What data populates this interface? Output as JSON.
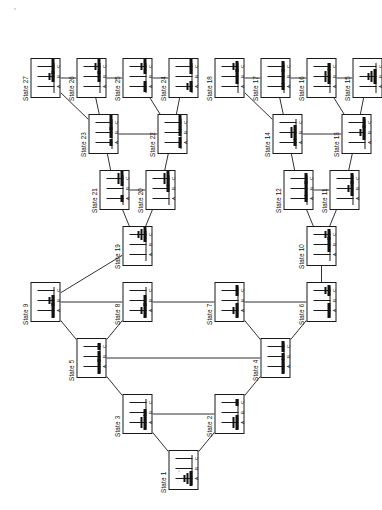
{
  "diagram": {
    "type": "tree",
    "peg_labels": [
      "A",
      "B",
      "C"
    ],
    "disk_count": 3,
    "state_count": 27,
    "label_prefix": "State",
    "stroke_color": "#1a1a1a",
    "disk_color": "#111111",
    "background": "#ffffff"
  },
  "states": [
    {
      "id": 1,
      "label": "State 1",
      "pegs": [
        [
          3,
          2,
          1
        ],
        [],
        []
      ],
      "x": 20,
      "y": 168
    },
    {
      "id": 2,
      "label": "State 2",
      "pegs": [
        [
          3,
          2
        ],
        [],
        [
          1
        ]
      ],
      "x": 76,
      "y": 214
    },
    {
      "id": 3,
      "label": "State 3",
      "pegs": [
        [
          3,
          2
        ],
        [
          1
        ],
        []
      ],
      "x": 76,
      "y": 122
    },
    {
      "id": 4,
      "label": "State 4",
      "pegs": [
        [
          3
        ],
        [
          1
        ],
        [
          2
        ]
      ],
      "x": 132,
      "y": 260
    },
    {
      "id": 5,
      "label": "State 5",
      "pegs": [
        [
          3
        ],
        [
          2
        ],
        [
          1
        ]
      ],
      "x": 132,
      "y": 76
    },
    {
      "id": 6,
      "label": "State 6",
      "pegs": [
        [
          3
        ],
        [],
        [
          2,
          1
        ]
      ],
      "x": 188,
      "y": 306
    },
    {
      "id": 7,
      "label": "State 7",
      "pegs": [
        [
          3,
          1
        ],
        [],
        [
          2
        ]
      ],
      "x": 188,
      "y": 214
    },
    {
      "id": 8,
      "label": "State 8",
      "pegs": [
        [
          3,
          1
        ],
        [
          2
        ],
        []
      ],
      "x": 188,
      "y": 122
    },
    {
      "id": 9,
      "label": "State 9",
      "pegs": [
        [
          3
        ],
        [
          2,
          1
        ],
        []
      ],
      "x": 188,
      "y": 30
    },
    {
      "id": 10,
      "label": "State 10",
      "pegs": [
        [],
        [
          3
        ],
        [
          2,
          1
        ]
      ],
      "x": 244,
      "y": 306
    },
    {
      "id": 11,
      "label": "State 11",
      "pegs": [
        [],
        [
          3,
          1
        ],
        [
          2
        ]
      ],
      "x": 300,
      "y": 329
    },
    {
      "id": 12,
      "label": "State 12",
      "pegs": [
        [
          1
        ],
        [
          3
        ],
        [
          2
        ]
      ],
      "x": 300,
      "y": 283
    },
    {
      "id": 13,
      "label": "State 13",
      "pegs": [
        [],
        [
          3,
          1
        ],
        [
          2
        ]
      ],
      "x": 356,
      "y": 341
    },
    {
      "id": 14,
      "label": "State 14",
      "pegs": [
        [
          1
        ],
        [
          3,
          2
        ],
        []
      ],
      "x": 356,
      "y": 272
    },
    {
      "id": 15,
      "label": "State 15",
      "pegs": [
        [],
        [
          3,
          2,
          1
        ],
        []
      ],
      "x": 412,
      "y": 352
    },
    {
      "id": 16,
      "label": "State 16",
      "pegs": [
        [],
        [
          3,
          2
        ],
        [
          1
        ]
      ],
      "x": 412,
      "y": 306
    },
    {
      "id": 17,
      "label": "State 17",
      "pegs": [
        [
          1
        ],
        [
          3
        ],
        [
          2
        ]
      ],
      "x": 412,
      "y": 260
    },
    {
      "id": 18,
      "label": "State 18",
      "pegs": [
        [],
        [
          3
        ],
        [
          2,
          1
        ]
      ],
      "x": 412,
      "y": 214
    },
    {
      "id": 19,
      "label": "State 19",
      "pegs": [
        [],
        [],
        [
          3,
          2,
          1
        ]
      ],
      "x": 244,
      "y": 122
    },
    {
      "id": 20,
      "label": "State 20",
      "pegs": [
        [],
        [
          1
        ],
        [
          3,
          2
        ]
      ],
      "x": 300,
      "y": 145
    },
    {
      "id": 21,
      "label": "State 21",
      "pegs": [
        [
          1
        ],
        [],
        [
          3,
          2
        ]
      ],
      "x": 300,
      "y": 99
    },
    {
      "id": 22,
      "label": "State 22",
      "pegs": [
        [
          2
        ],
        [
          1
        ],
        [
          3
        ]
      ],
      "x": 356,
      "y": 157
    },
    {
      "id": 23,
      "label": "State 23",
      "pegs": [
        [
          1
        ],
        [
          2
        ],
        [
          3
        ]
      ],
      "x": 356,
      "y": 88
    },
    {
      "id": 24,
      "label": "State 24",
      "pegs": [
        [
          2,
          1
        ],
        [],
        [
          3
        ]
      ],
      "x": 412,
      "y": 168
    },
    {
      "id": 25,
      "label": "State 25",
      "pegs": [
        [
          2
        ],
        [],
        [
          3,
          1
        ]
      ],
      "x": 412,
      "y": 122
    },
    {
      "id": 26,
      "label": "State 26",
      "pegs": [
        [],
        [
          2
        ],
        [
          3,
          1
        ]
      ],
      "x": 412,
      "y": 76
    },
    {
      "id": 27,
      "label": "State 27",
      "pegs": [
        [],
        [
          2,
          1
        ],
        [
          3
        ]
      ],
      "x": 412,
      "y": 30
    }
  ],
  "edges": [
    [
      1,
      3
    ],
    [
      1,
      2
    ],
    [
      3,
      5
    ],
    [
      2,
      4
    ],
    [
      5,
      9
    ],
    [
      5,
      8
    ],
    [
      4,
      7
    ],
    [
      4,
      6
    ],
    [
      9,
      19
    ],
    [
      6,
      10
    ],
    [
      19,
      21
    ],
    [
      19,
      20
    ],
    [
      10,
      12
    ],
    [
      10,
      11
    ],
    [
      21,
      23
    ],
    [
      20,
      22
    ],
    [
      12,
      14
    ],
    [
      11,
      13
    ],
    [
      23,
      27
    ],
    [
      23,
      26
    ],
    [
      22,
      25
    ],
    [
      22,
      24
    ],
    [
      14,
      18
    ],
    [
      14,
      17
    ],
    [
      13,
      16
    ],
    [
      13,
      15
    ]
  ],
  "chains": [
    [
      3,
      2
    ],
    [
      5,
      4
    ],
    [
      9,
      8
    ],
    [
      8,
      7
    ],
    [
      7,
      6
    ],
    [
      21,
      20
    ],
    [
      23,
      22
    ],
    [
      27,
      26
    ],
    [
      26,
      25
    ],
    [
      25,
      24
    ],
    [
      12,
      11
    ],
    [
      14,
      13
    ],
    [
      18,
      17
    ],
    [
      17,
      16
    ],
    [
      16,
      15
    ]
  ],
  "label_offsets": {
    "default_dx": -3,
    "default_dy": -9
  }
}
